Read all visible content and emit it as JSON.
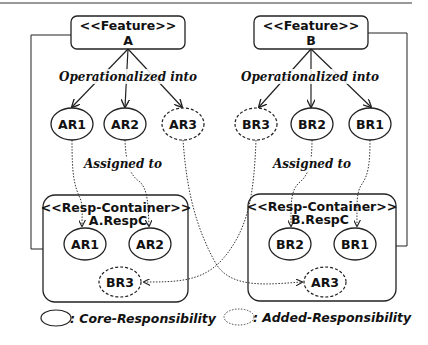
{
  "diagram": {
    "features": [
      {
        "stereotype": "<<Feature>>",
        "name": "A"
      },
      {
        "stereotype": "<<Feature>>",
        "name": "B"
      }
    ],
    "edge_labels": {
      "operationalized_left": "Operationalized into",
      "operationalized_right": "Operationalized into",
      "assigned_left": "Assigned to",
      "assigned_right": "Assigned to"
    },
    "responsibilities_top": {
      "left": [
        {
          "name": "AR1",
          "kind": "core"
        },
        {
          "name": "AR2",
          "kind": "core"
        },
        {
          "name": "AR3",
          "kind": "added"
        }
      ],
      "right": [
        {
          "name": "BR3",
          "kind": "added"
        },
        {
          "name": "BR2",
          "kind": "core"
        },
        {
          "name": "BR1",
          "kind": "core"
        }
      ]
    },
    "containers": [
      {
        "stereotype": "<<Resp-Container>>",
        "name": "A.RespC",
        "members": [
          {
            "name": "AR1",
            "kind": "core"
          },
          {
            "name": "AR2",
            "kind": "core"
          },
          {
            "name": "BR3",
            "kind": "added"
          }
        ]
      },
      {
        "stereotype": "<<Resp-Container>>",
        "name": "B.RespC",
        "members": [
          {
            "name": "BR2",
            "kind": "core"
          },
          {
            "name": "BR1",
            "kind": "core"
          },
          {
            "name": "AR3",
            "kind": "added"
          }
        ]
      }
    ],
    "legend": {
      "core": ": Core-Responsibility",
      "added": ": Added-Responsibility"
    }
  }
}
